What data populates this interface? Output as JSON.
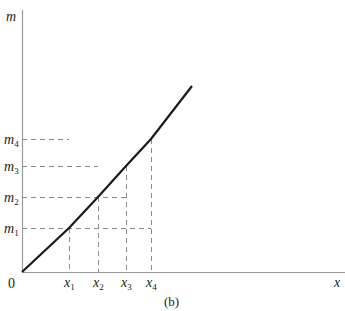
{
  "figure": {
    "caption": "(b)",
    "y_axis_label": "m",
    "x_axis_label": "x",
    "origin_label": "0",
    "y_ticks": [
      {
        "name": "m",
        "sub": "4",
        "y": 139
      },
      {
        "name": "m",
        "sub": "3",
        "y": 166
      },
      {
        "name": "m",
        "sub": "2",
        "y": 197
      },
      {
        "name": "m",
        "sub": "1",
        "y": 228
      }
    ],
    "x_ticks": [
      {
        "name": "x",
        "sub": "1",
        "x": 69
      },
      {
        "name": "x",
        "sub": "2",
        "x": 98
      },
      {
        "name": "x",
        "sub": "3",
        "x": 126
      },
      {
        "name": "x",
        "sub": "4",
        "x": 151
      }
    ],
    "colors": {
      "axis": "#9a9a9a",
      "curve": "#1a1a1a",
      "dash": "#8a8a8a",
      "text": "#222222"
    }
  },
  "chart_data": {
    "type": "line",
    "title": "",
    "caption": "(b)",
    "xlabel": "x",
    "ylabel": "m",
    "x_tick_labels": [
      "x1",
      "x2",
      "x3",
      "x4"
    ],
    "y_tick_labels": [
      "m1",
      "m2",
      "m3",
      "m4"
    ],
    "series": [
      {
        "name": "m(x)",
        "description": "slightly convex increasing curve from origin",
        "points_px": [
          [
            22,
            272
          ],
          [
            69,
            228
          ],
          [
            98,
            197
          ],
          [
            126,
            166
          ],
          [
            151,
            139
          ],
          [
            192,
            86
          ]
        ]
      }
    ],
    "grid": false,
    "dashed_projections": true
  }
}
